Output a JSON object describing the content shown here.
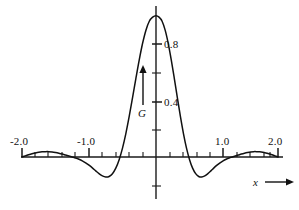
{
  "chart_data": {
    "type": "line",
    "title": "",
    "xlabel": "x",
    "ylabel": "G",
    "xlim": [
      -2.0,
      2.0
    ],
    "ylim": [
      -0.25,
      1.0
    ],
    "grid": false,
    "legend": null,
    "x_tick_labels": [
      "-2.0",
      "-1.0",
      "1.0",
      "2.0"
    ],
    "x_tick_values": [
      -2.0,
      -1.0,
      1.0,
      2.0
    ],
    "x_minor_step": 0.2,
    "y_tick_labels": [
      "0.4",
      "0.8"
    ],
    "y_tick_values": [
      0.4,
      0.8
    ],
    "y_minor_step": 0.2,
    "series": [
      {
        "name": "G(x)",
        "x": [
          -2.0,
          -1.95,
          -1.9,
          -1.85,
          -1.8,
          -1.75,
          -1.7,
          -1.65,
          -1.6,
          -1.55,
          -1.5,
          -1.45,
          -1.4,
          -1.35,
          -1.3,
          -1.25,
          -1.2,
          -1.15,
          -1.1,
          -1.05,
          -1.0,
          -0.95,
          -0.9,
          -0.85,
          -0.8,
          -0.75,
          -0.7,
          -0.65,
          -0.6,
          -0.55,
          -0.5,
          -0.45,
          -0.4,
          -0.35,
          -0.3,
          -0.25,
          -0.2,
          -0.15,
          -0.1,
          -0.05,
          0.0,
          0.05,
          0.1,
          0.15,
          0.2,
          0.25,
          0.3,
          0.35,
          0.4,
          0.45,
          0.5,
          0.55,
          0.6,
          0.65,
          0.7,
          0.75,
          0.8,
          0.85,
          0.9,
          0.95,
          1.0,
          1.05,
          1.1,
          1.15,
          1.2,
          1.25,
          1.3,
          1.35,
          1.4,
          1.45,
          1.5,
          1.55,
          1.6,
          1.65,
          1.7,
          1.75,
          1.8,
          1.85,
          1.9,
          1.95,
          2.0
        ],
        "y": [
          0.0,
          0.008,
          0.016,
          0.023,
          0.029,
          0.034,
          0.037,
          0.038,
          0.038,
          0.036,
          0.032,
          0.027,
          0.021,
          0.014,
          0.007,
          0.0,
          -0.007,
          -0.016,
          -0.027,
          -0.041,
          -0.058,
          -0.077,
          -0.098,
          -0.118,
          -0.134,
          -0.142,
          -0.138,
          -0.118,
          -0.079,
          -0.019,
          0.063,
          0.166,
          0.287,
          0.42,
          0.557,
          0.688,
          0.805,
          0.898,
          0.961,
          0.99,
          1.0,
          0.99,
          0.961,
          0.898,
          0.805,
          0.688,
          0.557,
          0.42,
          0.287,
          0.166,
          0.063,
          -0.019,
          -0.079,
          -0.118,
          -0.138,
          -0.142,
          -0.134,
          -0.118,
          -0.098,
          -0.077,
          -0.058,
          -0.041,
          -0.027,
          -0.016,
          -0.007,
          0.0,
          0.007,
          0.014,
          0.021,
          0.027,
          0.032,
          0.036,
          0.038,
          0.038,
          0.037,
          0.034,
          0.029,
          0.023,
          0.016,
          0.008,
          0.0
        ]
      }
    ],
    "annotations": [
      {
        "name": "y-axis-arrow",
        "label": "G",
        "direction": "up"
      },
      {
        "name": "x-axis-arrow",
        "label": "x",
        "direction": "right"
      }
    ]
  },
  "labels": {
    "x_axis_name": "x",
    "y_axis_name": "G",
    "x_neg_two": "-2.0",
    "x_neg_one": "-1.0",
    "x_pos_one": "1.0",
    "x_pos_two": "2.0",
    "y_zero_four": "0.4",
    "y_zero_eight": "0.8"
  },
  "colors": {
    "curve": "#111111",
    "axis": "#1a1a1a",
    "background": "#ffffff"
  }
}
